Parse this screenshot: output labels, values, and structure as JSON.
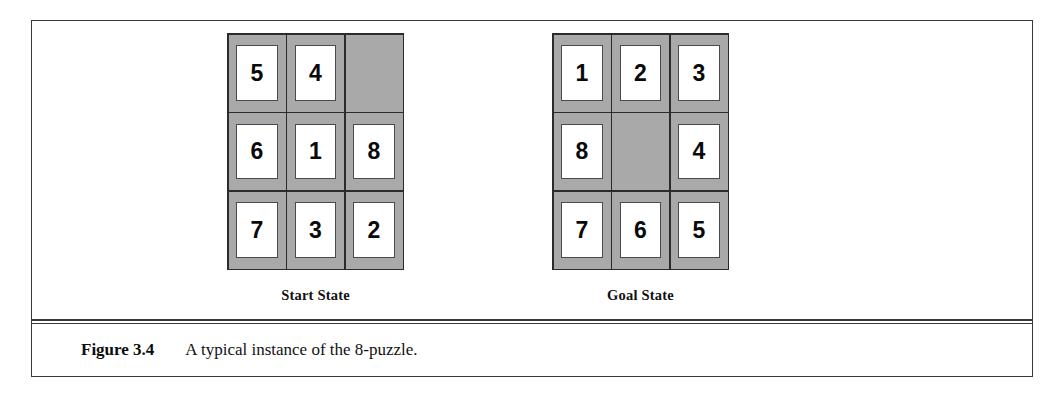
{
  "figure": {
    "caption_label": "Figure 3.4",
    "caption_text": "A typical instance of the 8-puzzle."
  },
  "boards": [
    {
      "id": "start-state",
      "label": "Start State",
      "tiles": [
        "5",
        "4",
        "",
        "6",
        "1",
        "8",
        "7",
        "3",
        "2"
      ]
    },
    {
      "id": "goal-state",
      "label": "Goal State",
      "tiles": [
        "1",
        "2",
        "3",
        "8",
        "",
        "4",
        "7",
        "6",
        "5"
      ]
    }
  ],
  "colors": {
    "board_background": "#a9a9a9",
    "grid_line": "#2b2b2b",
    "tile_face": "#ffffff",
    "tile_border": "#4a4a4a",
    "frame_border": "#3a3a3a",
    "text": "#0a0a0a"
  }
}
